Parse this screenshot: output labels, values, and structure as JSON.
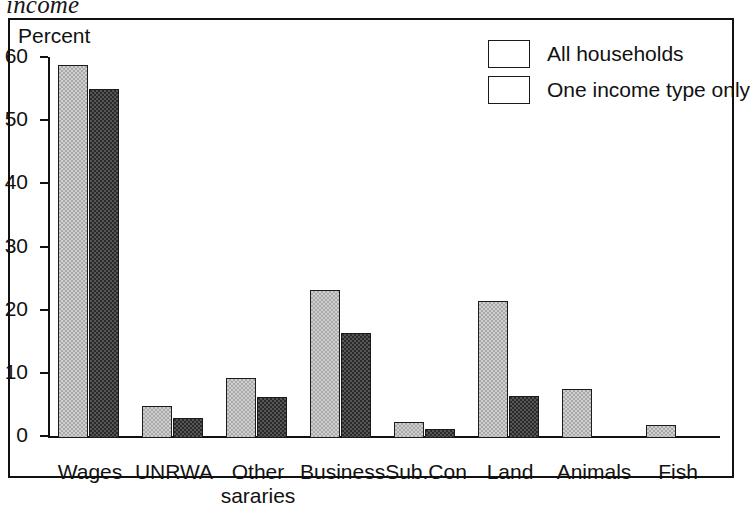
{
  "caption": "income",
  "chart_data": {
    "type": "bar",
    "title": "income",
    "ylabel": "Percent",
    "xlabel": "",
    "ylim": [
      0,
      60
    ],
    "yticks": [
      0,
      10,
      20,
      30,
      40,
      50,
      60
    ],
    "grid": false,
    "legend_position": "top-right",
    "categories": [
      "Wages",
      "UNRWA",
      "Other sararies",
      "Business",
      "Sub.Con",
      "Land",
      "Animals",
      "Fish"
    ],
    "series": [
      {
        "name": "All households",
        "color": "#cfcfcf",
        "values": [
          59.0,
          5.1,
          9.5,
          23.5,
          2.5,
          21.7,
          7.7,
          2.0
        ]
      },
      {
        "name": "One income type only",
        "color": "#2b2b2b",
        "values": [
          55.2,
          3.2,
          6.5,
          16.6,
          1.5,
          6.6,
          null,
          null
        ]
      }
    ]
  },
  "legend": {
    "items": [
      {
        "label": "All households"
      },
      {
        "label": "One income type only"
      }
    ]
  }
}
